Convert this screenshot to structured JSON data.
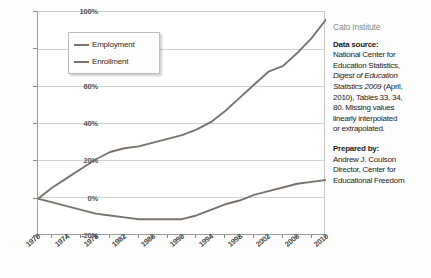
{
  "chart_data": {
    "type": "line",
    "title": "",
    "xlabel": "",
    "ylabel": "",
    "xlim": [
      1970,
      2010
    ],
    "ylim": [
      -20,
      100
    ],
    "grid": true,
    "legend_position": "upper-left-inside",
    "ytick_labels": [
      "100%",
      "80%",
      "60%",
      "40%",
      "20%",
      "0%",
      "-20%"
    ],
    "ytick_values": [
      100,
      80,
      60,
      40,
      20,
      0,
      -20
    ],
    "xtick_labels": [
      "1970",
      "1974",
      "1978",
      "1982",
      "1986",
      "1990",
      "1994",
      "1998",
      "2002",
      "2006",
      "2010"
    ],
    "xtick_values": [
      1970,
      1974,
      1978,
      1982,
      1986,
      1990,
      1994,
      1998,
      2002,
      2006,
      2010
    ],
    "x": [
      1970,
      1972,
      1974,
      1976,
      1978,
      1980,
      1982,
      1984,
      1986,
      1988,
      1990,
      1992,
      1994,
      1996,
      1998,
      2000,
      2002,
      2004,
      2006,
      2008,
      2010
    ],
    "series": [
      {
        "name": "Employment",
        "color": "#7a736d",
        "values": [
          0,
          6,
          11,
          16,
          21,
          25,
          27,
          28,
          30,
          32,
          34,
          37,
          41,
          47,
          54,
          61,
          68,
          71,
          78,
          86,
          96
        ]
      },
      {
        "name": "Enrollment",
        "color": "#7a736d",
        "values": [
          0,
          -2,
          -4,
          -6,
          -8,
          -9,
          -10,
          -11,
          -11,
          -11,
          -11,
          -9,
          -6,
          -3,
          -1,
          2,
          4,
          6,
          8,
          9,
          10
        ]
      }
    ]
  },
  "legend": {
    "items": [
      {
        "label": "Employment"
      },
      {
        "label": "Enrollment"
      }
    ]
  },
  "panel": {
    "organization": "Cato Institute",
    "data_source_label": "Data source:",
    "data_source_line1": "National Center for",
    "data_source_line2": "Education Statistics,",
    "data_source_italic": "Digest of Education",
    "data_source_italic2": "Statistics 2009",
    "data_source_line3": " (April,",
    "data_source_line4": "2010), Tables 33, 34,",
    "data_source_line5": "80.  Missing values",
    "data_source_line6": "linearly interpolated",
    "data_source_line7": "or extrapolated.",
    "prepared_by_label": "Prepared by:",
    "prepared_by_line1": "Andrew J. Coulson",
    "prepared_by_line2": "Director, Center for",
    "prepared_by_line3": "Educational Freedom"
  }
}
